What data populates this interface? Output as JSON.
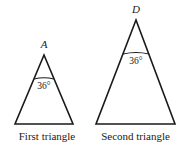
{
  "figure": {
    "background_color": "#ffffff",
    "line_color": "#1a1a1a",
    "triangles": [
      {
        "id": "first-triangle",
        "caption": "First triangle",
        "apex_label": "A",
        "apex_angle": "36°",
        "apex": {
          "x": 44,
          "y": 55
        },
        "base_left": {
          "x": 15,
          "y": 124
        },
        "base_right": {
          "x": 73,
          "y": 124
        },
        "arc_left": {
          "x": 34,
          "y": 79
        },
        "arc_right": {
          "x": 54,
          "y": 79
        },
        "angle_label_pos": {
          "x": 44,
          "y": 89
        },
        "apex_label_pos": {
          "x": 44,
          "y": 48
        }
      },
      {
        "id": "second-triangle",
        "caption": "Second triangle",
        "apex_label": "D",
        "apex_angle": "36°",
        "apex": {
          "x": 136,
          "y": 20
        },
        "base_left": {
          "x": 96,
          "y": 124
        },
        "base_right": {
          "x": 175,
          "y": 124
        },
        "arc_left": {
          "x": 123,
          "y": 54
        },
        "arc_right": {
          "x": 149,
          "y": 54
        },
        "angle_label_pos": {
          "x": 136,
          "y": 64
        },
        "apex_label_pos": {
          "x": 136,
          "y": 13
        }
      }
    ]
  }
}
